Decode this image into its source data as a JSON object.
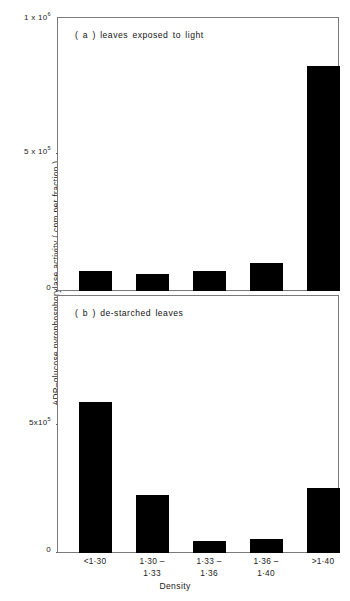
{
  "chart_data": {
    "type": "bar",
    "title": "",
    "xlabel": "Density",
    "ylabel": "ADP–glucose pyrophosphorylase activity ( cpm per fraction )",
    "categories": [
      "<1·30",
      "1·30–\n1·33",
      "1·33–\n1·36",
      "1·36–\n1·40",
      ">1·40"
    ],
    "category_lines": [
      [
        "<1·30",
        ""
      ],
      [
        "1·30 –",
        "1·33"
      ],
      [
        "1·33 –",
        "1·36"
      ],
      [
        "1·36 –",
        "1·40"
      ],
      [
        ">1·40",
        ""
      ]
    ],
    "grid": false,
    "legend": "none",
    "panels": [
      {
        "id": "a",
        "caption": "( a )  leaves  exposed to light",
        "values": [
          73000,
          62000,
          73000,
          102000,
          820000
        ],
        "ylim": [
          0,
          1000000
        ],
        "yticks": [
          0,
          500000,
          1000000
        ],
        "ytick_labels": [
          "0",
          "5 x 10",
          "1 x 10"
        ],
        "ytick_exponents": [
          "",
          "5",
          "6"
        ]
      },
      {
        "id": "b",
        "caption": "( b )  de-starched leaves",
        "values": [
          590000,
          227000,
          47000,
          55000,
          254000
        ],
        "ylim": [
          0,
          1000000
        ],
        "yticks": [
          0,
          500000
        ],
        "ytick_labels": [
          "0",
          "5x10"
        ],
        "ytick_exponents": [
          "",
          "5"
        ]
      }
    ],
    "colors": {
      "bar": "#000000",
      "frame": "#7a7a7a",
      "text": "#1a1a1a",
      "background": "#ffffff"
    }
  }
}
